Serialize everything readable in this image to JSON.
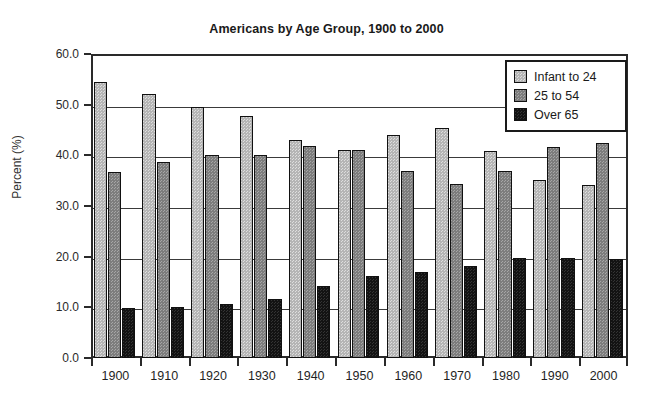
{
  "chart_data": {
    "type": "bar",
    "title": "Americans by Age Group, 1900 to 2000",
    "xlabel": "",
    "ylabel": "Percent (%)",
    "ylim": [
      0.0,
      60.0
    ],
    "ytick_labels": [
      "0.0",
      "10.0",
      "20.0",
      "30.0",
      "40.0",
      "50.0",
      "60.0"
    ],
    "ytick_values": [
      0,
      10,
      20,
      30,
      40,
      50,
      60
    ],
    "grid": true,
    "legend_position": "top-right",
    "categories": [
      "1900",
      "1910",
      "1920",
      "1930",
      "1940",
      "1950",
      "1960",
      "1970",
      "1980",
      "1990",
      "2000"
    ],
    "series": [
      {
        "name": "Infant to 24",
        "color": "#b5b5b5",
        "values": [
          54.5,
          52.2,
          49.6,
          47.8,
          43.1,
          41.1,
          44.0,
          45.3,
          40.8,
          35.2,
          34.2
        ]
      },
      {
        "name": "25 to 54",
        "color": "#7d7d7d",
        "values": [
          36.7,
          38.6,
          40.1,
          40.1,
          41.8,
          41.0,
          36.9,
          34.3,
          37.0,
          41.6,
          42.4
        ]
      },
      {
        "name": "Over 65",
        "color": "#131313",
        "values": [
          9.8,
          10.1,
          10.6,
          11.7,
          14.2,
          16.1,
          16.9,
          18.2,
          19.8,
          19.7,
          19.6
        ]
      }
    ]
  },
  "legend": {
    "entries": [
      "Infant to 24",
      "25 to 54",
      "Over 65"
    ]
  }
}
